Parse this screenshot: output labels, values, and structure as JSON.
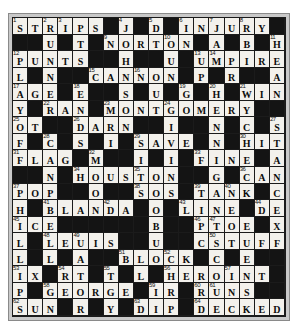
{
  "puzzle": {
    "title": "Crossword Puzzle Grid",
    "rows": 18,
    "cols": 18,
    "colors": {
      "white_cell": "#f3f1ec",
      "black_cell": "#141414",
      "frame": "#c9c9c9",
      "text": "#0d0d0d"
    },
    "grid": [
      [
        {
          "n": "1",
          "l": "S"
        },
        {
          "l": "T"
        },
        {
          "n": "2",
          "l": "R"
        },
        {
          "n": "3",
          "l": "I"
        },
        {
          "l": "P"
        },
        {
          "l": "S"
        },
        null,
        {
          "n": "4",
          "l": "J"
        },
        null,
        {
          "n": "5",
          "l": "D"
        },
        null,
        {
          "n": "6",
          "l": "I"
        },
        {
          "l": "N"
        },
        {
          "n": "7",
          "l": "J"
        },
        {
          "l": "U"
        },
        {
          "n": "8",
          "l": "R"
        },
        {
          "l": "Y"
        },
        null
      ],
      [
        null,
        null,
        {
          "l": "U"
        },
        null,
        {
          "l": "T"
        },
        null,
        {
          "n": "9",
          "l": "N"
        },
        {
          "l": "O"
        },
        {
          "l": "R"
        },
        {
          "l": "T"
        },
        {
          "n": "10",
          "l": "O"
        },
        {
          "l": "N"
        },
        null,
        {
          "l": "A"
        },
        null,
        {
          "l": "B"
        },
        null,
        {
          "n": "11",
          "l": "H"
        }
      ],
      [
        {
          "n": "12",
          "l": "P"
        },
        {
          "l": "U"
        },
        {
          "l": "N"
        },
        {
          "l": "T"
        },
        {
          "l": "S"
        },
        null,
        null,
        {
          "l": "H"
        },
        null,
        null,
        {
          "l": "U"
        },
        null,
        {
          "n": "13",
          "l": "U"
        },
        {
          "n": "14",
          "l": "M"
        },
        {
          "l": "P"
        },
        {
          "l": "I"
        },
        {
          "l": "R"
        },
        {
          "l": "E"
        }
      ],
      [
        {
          "l": "L"
        },
        null,
        {
          "l": "N"
        },
        null,
        null,
        {
          "n": "15",
          "l": "C"
        },
        {
          "l": "A"
        },
        {
          "l": "N"
        },
        {
          "n": "16",
          "l": "N"
        },
        {
          "l": "O"
        },
        {
          "l": "N"
        },
        null,
        {
          "l": "P"
        },
        null,
        {
          "l": "R"
        },
        null,
        null,
        {
          "l": "A"
        }
      ],
      [
        {
          "n": "17",
          "l": "A"
        },
        {
          "l": "G"
        },
        {
          "l": "E"
        },
        null,
        {
          "n": "18",
          "l": "E"
        },
        null,
        null,
        {
          "l": "S"
        },
        null,
        {
          "l": "U"
        },
        null,
        {
          "n": "19",
          "l": "G"
        },
        null,
        {
          "n": "20",
          "l": "H"
        },
        null,
        {
          "n": "21",
          "l": "W"
        },
        {
          "l": "I"
        },
        {
          "l": "N"
        }
      ],
      [
        {
          "l": "Y"
        },
        null,
        {
          "n": "22",
          "l": "R"
        },
        {
          "l": "A"
        },
        {
          "l": "N"
        },
        null,
        {
          "n": "23",
          "l": "M"
        },
        {
          "l": "O"
        },
        {
          "l": "N"
        },
        {
          "l": "T"
        },
        {
          "n": "24",
          "l": "G"
        },
        {
          "l": "O"
        },
        {
          "l": "M"
        },
        {
          "l": "E"
        },
        {
          "l": "R"
        },
        {
          "l": "Y"
        },
        null,
        null
      ],
      [
        {
          "n": "25",
          "l": "O"
        },
        {
          "l": "T"
        },
        null,
        null,
        {
          "n": "26",
          "l": "D"
        },
        {
          "l": "A"
        },
        {
          "l": "R"
        },
        {
          "l": "N"
        },
        null,
        null,
        {
          "l": "I"
        },
        null,
        null,
        {
          "l": "N"
        },
        null,
        {
          "l": "C"
        },
        null,
        {
          "n": "27",
          "l": "S"
        }
      ],
      [
        {
          "l": "F"
        },
        null,
        {
          "n": "28",
          "l": "C"
        },
        null,
        {
          "l": "S"
        },
        null,
        {
          "l": "I"
        },
        null,
        {
          "n": "29",
          "l": "S"
        },
        {
          "l": "A"
        },
        {
          "l": "V"
        },
        {
          "l": "E"
        },
        null,
        {
          "l": "N"
        },
        null,
        {
          "n": "30",
          "l": "H"
        },
        {
          "l": "I"
        },
        {
          "l": "T"
        }
      ],
      [
        {
          "n": "31",
          "l": "F"
        },
        {
          "l": "L"
        },
        {
          "l": "A"
        },
        {
          "l": "G"
        },
        null,
        {
          "n": "32",
          "l": "M"
        },
        null,
        null,
        {
          "l": "I"
        },
        null,
        {
          "l": "I"
        },
        null,
        {
          "n": "33",
          "l": "F"
        },
        {
          "l": "I"
        },
        {
          "l": "N"
        },
        {
          "l": "E"
        },
        null,
        {
          "l": "A"
        }
      ],
      [
        null,
        null,
        {
          "l": "N"
        },
        null,
        {
          "n": "34",
          "l": "H"
        },
        {
          "l": "O"
        },
        {
          "l": "U"
        },
        {
          "l": "S"
        },
        {
          "n": "35",
          "l": "T"
        },
        {
          "l": "O"
        },
        {
          "l": "N"
        },
        null,
        null,
        {
          "l": "G"
        },
        null,
        {
          "n": "36",
          "l": "C"
        },
        {
          "l": "A"
        },
        {
          "l": "N"
        }
      ],
      [
        {
          "n": "37",
          "l": "P"
        },
        {
          "l": "O"
        },
        {
          "l": "P"
        },
        null,
        null,
        {
          "l": "O"
        },
        null,
        null,
        {
          "n": "38",
          "l": "S"
        },
        {
          "l": "O"
        },
        {
          "l": "S"
        },
        null,
        {
          "n": "39",
          "l": "T"
        },
        {
          "l": "A"
        },
        {
          "n": "40",
          "l": "N"
        },
        {
          "l": "K"
        },
        null,
        {
          "l": "C"
        }
      ],
      [
        {
          "l": "H"
        },
        null,
        {
          "n": "41",
          "l": "B"
        },
        {
          "l": "L"
        },
        {
          "l": "A"
        },
        {
          "l": "N"
        },
        {
          "n": "42",
          "l": "D"
        },
        {
          "l": "A"
        },
        null,
        {
          "l": "O"
        },
        null,
        {
          "n": "43",
          "l": "L"
        },
        {
          "l": "I"
        },
        {
          "l": "N"
        },
        {
          "l": "E"
        },
        null,
        {
          "n": "44",
          "l": "D"
        },
        {
          "l": "E"
        }
      ],
      [
        {
          "n": "45",
          "l": "I"
        },
        {
          "l": "C"
        },
        {
          "l": "E"
        },
        null,
        null,
        null,
        null,
        null,
        null,
        {
          "l": "B"
        },
        null,
        null,
        {
          "n": "46",
          "l": "P"
        },
        {
          "n": "47",
          "l": "T"
        },
        {
          "l": "O"
        },
        {
          "l": "E"
        },
        null,
        {
          "l": "X"
        }
      ],
      [
        {
          "l": "L"
        },
        null,
        {
          "n": "48",
          "l": "L"
        },
        {
          "l": "E"
        },
        {
          "n": "49",
          "l": "U"
        },
        {
          "l": "I"
        },
        {
          "l": "S"
        },
        null,
        null,
        {
          "l": "U"
        },
        null,
        null,
        {
          "l": "C"
        },
        {
          "n": "50",
          "l": "S"
        },
        {
          "l": "T"
        },
        {
          "l": "U"
        },
        {
          "l": "F"
        },
        {
          "l": "F"
        }
      ],
      [
        {
          "l": "L"
        },
        null,
        {
          "l": "L"
        },
        null,
        {
          "l": "A"
        },
        null,
        null,
        {
          "n": "51",
          "l": "B"
        },
        {
          "l": "L"
        },
        {
          "l": "O"
        },
        {
          "n": "52",
          "l": "C"
        },
        {
          "l": "K"
        },
        null,
        {
          "l": "C"
        },
        null,
        {
          "l": "E"
        },
        null,
        null
      ],
      [
        {
          "n": "53",
          "l": "I"
        },
        {
          "l": "X"
        },
        null,
        {
          "n": "54",
          "l": "R"
        },
        {
          "l": "T"
        },
        null,
        {
          "n": "55",
          "l": "T"
        },
        null,
        {
          "l": "L"
        },
        null,
        {
          "n": "56",
          "l": "H"
        },
        {
          "l": "E"
        },
        {
          "l": "R"
        },
        {
          "l": "O"
        },
        {
          "n": "57",
          "l": "I"
        },
        {
          "l": "N"
        },
        {
          "l": "T"
        },
        null
      ],
      [
        {
          "l": "P"
        },
        null,
        {
          "n": "58",
          "l": "G"
        },
        {
          "l": "E"
        },
        {
          "l": "O"
        },
        {
          "l": "R"
        },
        {
          "l": "G"
        },
        {
          "l": "E"
        },
        null,
        {
          "n": "59",
          "l": "I"
        },
        {
          "l": "R"
        },
        null,
        {
          "n": "60",
          "l": "R"
        },
        {
          "n": "61",
          "l": "U"
        },
        {
          "l": "N"
        },
        {
          "l": "S"
        },
        null,
        null
      ],
      [
        {
          "n": "62",
          "l": "S"
        },
        {
          "l": "U"
        },
        {
          "l": "N"
        },
        null,
        {
          "l": "R"
        },
        null,
        {
          "l": "Y"
        },
        null,
        {
          "n": "63",
          "l": "D"
        },
        {
          "l": "I"
        },
        {
          "l": "P"
        },
        null,
        {
          "n": "64",
          "l": "D"
        },
        {
          "l": "E"
        },
        {
          "l": "C"
        },
        {
          "l": "K"
        },
        {
          "l": "E"
        },
        {
          "l": "D"
        }
      ]
    ]
  }
}
